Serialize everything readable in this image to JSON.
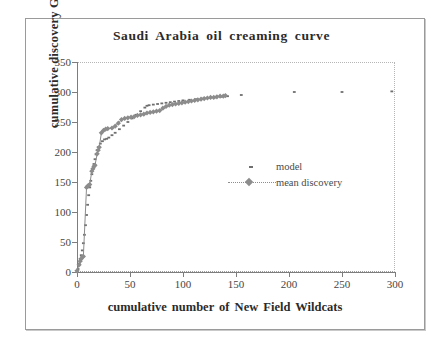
{
  "chart_data": {
    "type": "scatter",
    "title": "Saudi Arabia oil creaming curve",
    "xlabel": "cumulative number of New Field Wildcats",
    "ylabel": "cumulative discovery Gb",
    "xlim": [
      0,
      300
    ],
    "ylim": [
      0,
      350
    ],
    "xticks": [
      0,
      50,
      100,
      150,
      200,
      250,
      300
    ],
    "yticks": [
      0,
      50,
      100,
      150,
      200,
      250,
      300,
      350
    ],
    "grid": false,
    "legend_position": "center-right",
    "series": [
      {
        "name": "model",
        "marker": "small-dot",
        "color": "#6f6f6f",
        "points": [
          [
            1,
            5
          ],
          [
            2,
            14
          ],
          [
            3,
            22
          ],
          [
            4,
            28
          ],
          [
            5,
            36
          ],
          [
            6,
            48
          ],
          [
            7,
            62
          ],
          [
            8,
            78
          ],
          [
            9,
            95
          ],
          [
            10,
            112
          ],
          [
            11,
            128
          ],
          [
            12,
            141
          ],
          [
            13,
            152
          ],
          [
            14,
            163
          ],
          [
            15,
            172
          ],
          [
            16,
            180
          ],
          [
            17,
            188
          ],
          [
            18,
            196
          ],
          [
            19,
            203
          ],
          [
            20,
            208
          ],
          [
            22,
            214
          ],
          [
            24,
            218
          ],
          [
            26,
            221
          ],
          [
            28,
            222
          ],
          [
            30,
            224
          ],
          [
            33,
            228
          ],
          [
            36,
            232
          ],
          [
            40,
            238
          ],
          [
            44,
            244
          ],
          [
            48,
            250
          ],
          [
            52,
            256
          ],
          [
            56,
            262
          ],
          [
            60,
            268
          ],
          [
            64,
            274
          ],
          [
            66,
            277
          ],
          [
            68,
            278
          ],
          [
            72,
            279
          ],
          [
            76,
            280
          ],
          [
            80,
            281
          ],
          [
            84,
            282
          ],
          [
            88,
            283
          ],
          [
            92,
            284
          ],
          [
            96,
            285
          ],
          [
            100,
            286
          ],
          [
            106,
            287
          ],
          [
            112,
            288
          ],
          [
            118,
            289
          ],
          [
            124,
            290
          ],
          [
            130,
            291
          ],
          [
            136,
            292
          ],
          [
            142,
            293
          ],
          [
            155,
            295
          ],
          [
            205,
            300
          ],
          [
            250,
            300
          ],
          [
            297,
            301
          ]
        ]
      },
      {
        "name": "mean discovery",
        "marker": "diamond",
        "color": "#8c8c8c",
        "points": [
          [
            0,
            2
          ],
          [
            2,
            12
          ],
          [
            3,
            18
          ],
          [
            4,
            22
          ],
          [
            5,
            25
          ],
          [
            6,
            26
          ],
          [
            9,
            141
          ],
          [
            10,
            143
          ],
          [
            11,
            144
          ],
          [
            12,
            146
          ],
          [
            14,
            168
          ],
          [
            15,
            172
          ],
          [
            16,
            176
          ],
          [
            17,
            178
          ],
          [
            19,
            197
          ],
          [
            20,
            203
          ],
          [
            21,
            208
          ],
          [
            23,
            232
          ],
          [
            25,
            236
          ],
          [
            27,
            238
          ],
          [
            29,
            239
          ],
          [
            33,
            240
          ],
          [
            36,
            243
          ],
          [
            39,
            248
          ],
          [
            42,
            254
          ],
          [
            45,
            256
          ],
          [
            48,
            257
          ],
          [
            51,
            258
          ],
          [
            54,
            259
          ],
          [
            57,
            261
          ],
          [
            60,
            262
          ],
          [
            63,
            263
          ],
          [
            66,
            265
          ],
          [
            69,
            266
          ],
          [
            72,
            267
          ],
          [
            75,
            268
          ],
          [
            78,
            269
          ],
          [
            81,
            273
          ],
          [
            84,
            276
          ],
          [
            87,
            278
          ],
          [
            90,
            279
          ],
          [
            93,
            280
          ],
          [
            96,
            281
          ],
          [
            99,
            282
          ],
          [
            102,
            283
          ],
          [
            105,
            284
          ],
          [
            108,
            285
          ],
          [
            111,
            286
          ],
          [
            114,
            287
          ],
          [
            117,
            288
          ],
          [
            120,
            289
          ],
          [
            123,
            290
          ],
          [
            126,
            291
          ],
          [
            129,
            291
          ],
          [
            132,
            292
          ],
          [
            135,
            293
          ],
          [
            138,
            293
          ],
          [
            140,
            294
          ]
        ]
      }
    ]
  },
  "legend": {
    "items": [
      {
        "label": "model"
      },
      {
        "label": "mean discovery"
      }
    ]
  }
}
